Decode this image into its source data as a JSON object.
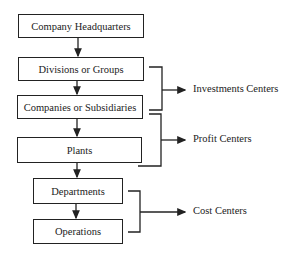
{
  "diagram": {
    "boxes": [
      {
        "id": "hq",
        "label": "Company Headquarters"
      },
      {
        "id": "divisions",
        "label": "Divisions or Groups"
      },
      {
        "id": "companies",
        "label": "Companies or Subsidiaries"
      },
      {
        "id": "plants",
        "label": "Plants"
      },
      {
        "id": "departments",
        "label": "Departments"
      },
      {
        "id": "operations",
        "label": "Operations"
      }
    ],
    "groups": [
      {
        "id": "investment",
        "label": "Investments Centers",
        "covers": [
          "divisions",
          "companies"
        ]
      },
      {
        "id": "profit",
        "label": "Profit Centers",
        "covers": [
          "companies",
          "plants"
        ]
      },
      {
        "id": "cost",
        "label": "Cost Centers",
        "covers": [
          "departments",
          "operations"
        ]
      }
    ],
    "line_color": "#222222"
  }
}
